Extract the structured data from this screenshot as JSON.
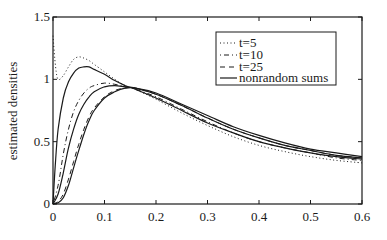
{
  "chart_data": {
    "type": "line",
    "title": "",
    "xlabel": "",
    "ylabel": "estimated densities",
    "xlim": [
      0,
      0.6
    ],
    "ylim": [
      0,
      1.5
    ],
    "xticks": [
      0,
      0.1,
      0.2,
      0.3,
      0.4,
      0.5,
      0.6
    ],
    "xtick_labels": [
      "0",
      "0.1",
      "0.2",
      "0.3",
      "0.4",
      "0.5",
      "0.6"
    ],
    "yticks": [
      0,
      0.5,
      1,
      1.5
    ],
    "ytick_labels": [
      "0",
      "0.5",
      "1",
      "1.5"
    ],
    "grid": false,
    "legend_position": "upper right",
    "legend": [
      "t=5",
      "t=10",
      "t=25",
      "nonrandom sums"
    ],
    "series": [
      {
        "name": "t=5",
        "style": "dotted",
        "x": [
          0,
          0.005,
          0.01,
          0.02,
          0.03,
          0.04,
          0.05,
          0.06,
          0.07,
          0.08,
          0.1,
          0.12,
          0.14,
          0.16,
          0.2,
          0.25,
          0.3,
          0.35,
          0.4,
          0.45,
          0.5,
          0.55,
          0.6
        ],
        "y": [
          1.35,
          1.1,
          1.0,
          1.03,
          1.1,
          1.16,
          1.18,
          1.17,
          1.15,
          1.12,
          1.06,
          1.0,
          0.95,
          0.92,
          0.84,
          0.73,
          0.63,
          0.54,
          0.47,
          0.42,
          0.38,
          0.35,
          0.33
        ]
      },
      {
        "name": "nonrandom sums (t=5)",
        "style": "solid",
        "x": [
          0,
          0.005,
          0.01,
          0.02,
          0.03,
          0.04,
          0.05,
          0.06,
          0.07,
          0.08,
          0.1,
          0.12,
          0.14,
          0.16,
          0.2,
          0.25,
          0.3,
          0.35,
          0.4,
          0.45,
          0.5,
          0.55,
          0.6
        ],
        "y": [
          0,
          0.35,
          0.6,
          0.85,
          0.98,
          1.05,
          1.09,
          1.1,
          1.1,
          1.08,
          1.04,
          0.99,
          0.95,
          0.92,
          0.85,
          0.75,
          0.65,
          0.57,
          0.5,
          0.45,
          0.41,
          0.38,
          0.36
        ]
      },
      {
        "name": "t=10",
        "style": "dashdot",
        "x": [
          0,
          0.01,
          0.02,
          0.03,
          0.04,
          0.05,
          0.06,
          0.07,
          0.08,
          0.1,
          0.12,
          0.14,
          0.16,
          0.2,
          0.25,
          0.3,
          0.35,
          0.4,
          0.45,
          0.5,
          0.55,
          0.6
        ],
        "y": [
          0,
          0.15,
          0.4,
          0.6,
          0.74,
          0.83,
          0.89,
          0.93,
          0.95,
          0.97,
          0.96,
          0.94,
          0.92,
          0.86,
          0.76,
          0.66,
          0.57,
          0.5,
          0.45,
          0.41,
          0.37,
          0.35
        ]
      },
      {
        "name": "nonrandom sums (t=10)",
        "style": "solid",
        "x": [
          0,
          0.01,
          0.02,
          0.03,
          0.04,
          0.05,
          0.06,
          0.07,
          0.08,
          0.1,
          0.12,
          0.14,
          0.16,
          0.2,
          0.25,
          0.3,
          0.35,
          0.4,
          0.45,
          0.5,
          0.55,
          0.6
        ],
        "y": [
          0,
          0.08,
          0.25,
          0.45,
          0.6,
          0.72,
          0.8,
          0.86,
          0.9,
          0.94,
          0.95,
          0.94,
          0.93,
          0.88,
          0.79,
          0.69,
          0.6,
          0.53,
          0.47,
          0.43,
          0.39,
          0.37
        ]
      },
      {
        "name": "t=25",
        "style": "dashed",
        "x": [
          0,
          0.01,
          0.02,
          0.03,
          0.04,
          0.05,
          0.06,
          0.07,
          0.08,
          0.1,
          0.12,
          0.14,
          0.16,
          0.2,
          0.25,
          0.3,
          0.35,
          0.4,
          0.45,
          0.5,
          0.55,
          0.6
        ],
        "y": [
          0,
          0.02,
          0.08,
          0.2,
          0.34,
          0.48,
          0.6,
          0.7,
          0.77,
          0.86,
          0.91,
          0.93,
          0.93,
          0.88,
          0.79,
          0.69,
          0.6,
          0.53,
          0.47,
          0.43,
          0.39,
          0.37
        ]
      },
      {
        "name": "nonrandom sums (t=25)",
        "style": "solid",
        "x": [
          0,
          0.01,
          0.02,
          0.03,
          0.04,
          0.05,
          0.06,
          0.07,
          0.08,
          0.1,
          0.12,
          0.14,
          0.16,
          0.2,
          0.25,
          0.3,
          0.35,
          0.4,
          0.45,
          0.5,
          0.55,
          0.6
        ],
        "y": [
          0,
          0.01,
          0.05,
          0.15,
          0.29,
          0.43,
          0.56,
          0.67,
          0.75,
          0.85,
          0.9,
          0.93,
          0.93,
          0.89,
          0.8,
          0.71,
          0.62,
          0.55,
          0.49,
          0.44,
          0.41,
          0.38
        ]
      }
    ]
  },
  "legend": {
    "items": [
      {
        "label": "t=5",
        "style": "dotted"
      },
      {
        "label": "t=10",
        "style": "dashdot"
      },
      {
        "label": "t=25",
        "style": "dashed"
      },
      {
        "label": "nonrandom sums",
        "style": "solid"
      }
    ]
  },
  "colors": {
    "line": "#1a1a1a",
    "background": "#ffffff"
  }
}
